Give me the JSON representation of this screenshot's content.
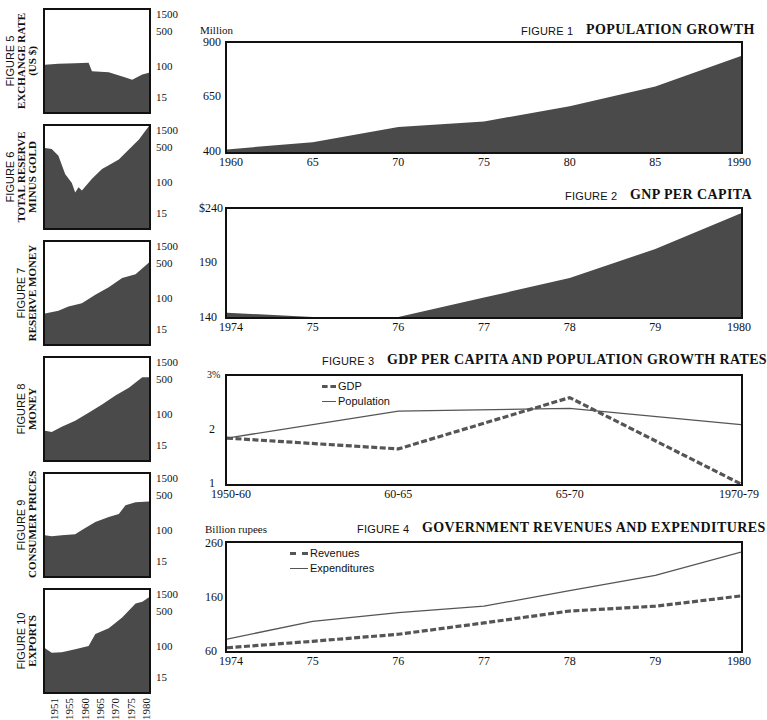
{
  "colors": {
    "fill": "#4a4a4a",
    "line": "#555555",
    "frame": "#111111"
  },
  "chart_data": [
    {
      "id": "fig1",
      "type": "area",
      "figure_label": "FIGURE 1",
      "title": "POPULATION GROWTH",
      "ylabel": "Million",
      "x": [
        "1960",
        "65",
        "70",
        "75",
        "80",
        "85",
        "1990"
      ],
      "values": [
        412,
        445,
        515,
        540,
        610,
        700,
        840
      ],
      "ylim": [
        400,
        900
      ],
      "yticks": [
        "900",
        "650",
        "400"
      ],
      "grid": false
    },
    {
      "id": "fig2",
      "type": "area",
      "figure_label": "FIGURE 2",
      "title": "GNP PER CAPITA",
      "ylabel": "",
      "x": [
        "1974",
        "75",
        "76",
        "77",
        "78",
        "79",
        "1980"
      ],
      "values": [
        144,
        140,
        140,
        158,
        176,
        203,
        236
      ],
      "ylim": [
        140,
        240
      ],
      "yticks": [
        "$240",
        "190",
        "140"
      ],
      "grid": false
    },
    {
      "id": "fig3",
      "type": "line",
      "figure_label": "FIGURE 3",
      "title": "GDP PER CAPITA AND POPULATION GROWTH RATES",
      "ylabel": "",
      "x": [
        "1950-60",
        "60-65",
        "65-70",
        "1970-79"
      ],
      "series": [
        {
          "name": "GDP",
          "style": "dashed",
          "values": [
            1.85,
            1.65,
            2.6,
            1.0
          ]
        },
        {
          "name": "Population",
          "style": "solid",
          "values": [
            1.85,
            2.35,
            2.4,
            2.1
          ]
        }
      ],
      "ylim": [
        1,
        3
      ],
      "yticks": [
        "3%",
        "2",
        "1"
      ],
      "legend_position": "upper-left",
      "grid": false
    },
    {
      "id": "fig4",
      "type": "line",
      "figure_label": "FIGURE 4",
      "title": "GOVERNMENT REVENUES AND EXPENDITURES",
      "ylabel": "Billion rupees",
      "x": [
        "1974",
        "75",
        "76",
        "77",
        "78",
        "79",
        "1980"
      ],
      "series": [
        {
          "name": "Revenues",
          "style": "dashed",
          "values": [
            66,
            78,
            91,
            112,
            134,
            143,
            162
          ]
        },
        {
          "name": "Expenditures",
          "style": "solid",
          "values": [
            82,
            115,
            131,
            143,
            172,
            200,
            243
          ]
        }
      ],
      "ylim": [
        60,
        260
      ],
      "yticks": [
        "260",
        "160",
        "60"
      ],
      "legend_position": "upper-left",
      "grid": false
    },
    {
      "id": "fig5",
      "type": "area",
      "scale": "log",
      "figure_label": "FIGURE 5",
      "title": "EXCHANGE RATE (US $)",
      "x": [
        1951,
        1955,
        1960,
        1964,
        1965,
        1970,
        1975,
        1977,
        1980,
        1982
      ],
      "values": [
        80,
        85,
        88,
        90,
        55,
        52,
        38,
        33,
        45,
        50
      ],
      "ylim": [
        5,
        2000
      ],
      "yticks": [
        "1500",
        "500",
        "100",
        "15"
      ]
    },
    {
      "id": "fig6",
      "type": "area",
      "scale": "log",
      "figure_label": "FIGURE 6",
      "title": "TOTAL RESERVE MINUS GOLD",
      "x": [
        1951,
        1953,
        1955,
        1957,
        1959,
        1960,
        1961,
        1962,
        1965,
        1968,
        1970,
        1973,
        1976,
        1979,
        1982
      ],
      "values": [
        550,
        520,
        350,
        120,
        70,
        40,
        55,
        45,
        90,
        160,
        200,
        280,
        500,
        900,
        2000
      ],
      "ylim": [
        5,
        2000
      ],
      "yticks": [
        "1500",
        "500",
        "100",
        "15"
      ]
    },
    {
      "id": "fig7",
      "type": "area",
      "scale": "log",
      "figure_label": "FIGURE 7",
      "title": "RESERVE MONEY",
      "x": [
        1951,
        1955,
        1958,
        1962,
        1966,
        1970,
        1974,
        1978,
        1982
      ],
      "values": [
        30,
        35,
        45,
        55,
        90,
        140,
        240,
        300,
        600
      ],
      "ylim": [
        5,
        2000
      ],
      "yticks": [
        "1500",
        "500",
        "100",
        "15"
      ]
    },
    {
      "id": "fig8",
      "type": "area",
      "scale": "log",
      "figure_label": "FIGURE 8",
      "title": "MONEY",
      "x": [
        1951,
        1953,
        1956,
        1960,
        1964,
        1968,
        1972,
        1976,
        1980,
        1982
      ],
      "values": [
        28,
        26,
        35,
        50,
        80,
        130,
        220,
        350,
        650,
        650
      ],
      "ylim": [
        5,
        2000
      ],
      "yticks": [
        "1500",
        "500",
        "100",
        "15"
      ]
    },
    {
      "id": "fig9",
      "type": "area",
      "scale": "log",
      "figure_label": "FIGURE 9",
      "title": "CONSUMER PRICES",
      "x": [
        1951,
        1953,
        1956,
        1960,
        1962,
        1966,
        1970,
        1973,
        1975,
        1978,
        1982
      ],
      "values": [
        55,
        52,
        55,
        58,
        75,
        120,
        160,
        190,
        320,
        380,
        400
      ],
      "ylim": [
        5,
        2000
      ],
      "yticks": [
        "1500",
        "500",
        "100",
        "15"
      ]
    },
    {
      "id": "fig10",
      "type": "area",
      "scale": "log",
      "figure_label": "FIGURE 10",
      "title": "EXPORTS",
      "x": [
        1951,
        1953,
        1956,
        1960,
        1964,
        1966,
        1970,
        1974,
        1978,
        1980,
        1982
      ],
      "values": [
        65,
        50,
        52,
        62,
        75,
        150,
        210,
        400,
        900,
        1000,
        1300
      ],
      "ylim": [
        5,
        2000
      ],
      "yticks": [
        "1500",
        "500",
        "100",
        "15"
      ],
      "xticks": [
        "1951",
        "1955",
        "1960",
        "1965",
        "1970",
        "1975",
        "1980"
      ]
    }
  ],
  "left_panel": {
    "yticks": [
      "1500",
      "500",
      "100",
      "15"
    ],
    "years": [
      "1951",
      "1955",
      "1960",
      "1965",
      "1970",
      "1975",
      "1980"
    ]
  }
}
